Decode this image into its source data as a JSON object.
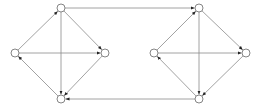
{
  "diagram": {
    "type": "directed-graph",
    "colors": {
      "edge": "#8a8a8a",
      "node_stroke": "#777777",
      "node_fill": "#ffffff",
      "arrow": "#222222",
      "background": "#ffffff"
    },
    "node_radius": 4,
    "nodes": [
      {
        "id": "A_top",
        "x": 61,
        "y": 8
      },
      {
        "id": "A_left",
        "x": 15,
        "y": 53
      },
      {
        "id": "A_right",
        "x": 105,
        "y": 53
      },
      {
        "id": "A_bottom",
        "x": 61,
        "y": 99
      },
      {
        "id": "B_top",
        "x": 199,
        "y": 8
      },
      {
        "id": "B_left",
        "x": 154,
        "y": 53
      },
      {
        "id": "B_right",
        "x": 246,
        "y": 53
      },
      {
        "id": "B_bottom",
        "x": 199,
        "y": 99
      }
    ],
    "edges": [
      {
        "from": "A_left",
        "to": "A_top"
      },
      {
        "from": "A_top",
        "to": "A_right"
      },
      {
        "from": "A_top",
        "to": "A_bottom"
      },
      {
        "from": "A_left",
        "to": "A_right"
      },
      {
        "from": "A_right",
        "to": "A_bottom"
      },
      {
        "from": "A_bottom",
        "to": "A_left"
      },
      {
        "from": "B_left",
        "to": "B_top"
      },
      {
        "from": "B_top",
        "to": "B_right"
      },
      {
        "from": "B_top",
        "to": "B_bottom"
      },
      {
        "from": "B_left",
        "to": "B_right"
      },
      {
        "from": "B_right",
        "to": "B_bottom"
      },
      {
        "from": "B_bottom",
        "to": "B_left"
      },
      {
        "from": "A_top",
        "to": "B_top"
      },
      {
        "from": "B_bottom",
        "to": "A_bottom"
      }
    ]
  }
}
